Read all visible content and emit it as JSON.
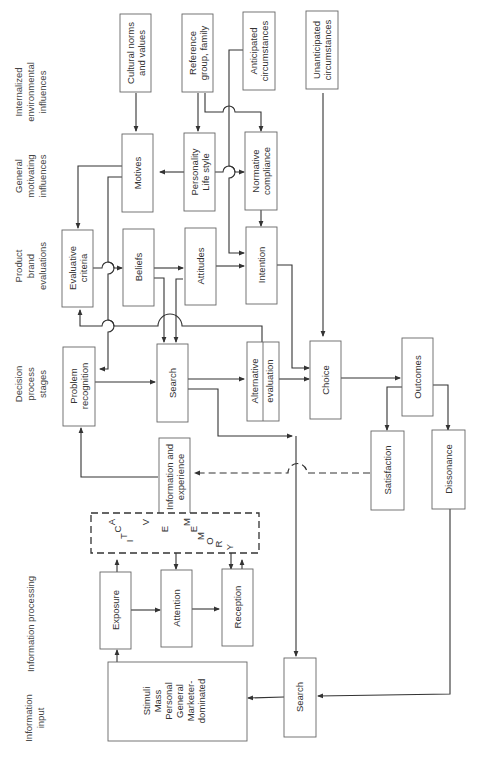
{
  "row_labels": {
    "internalized": [
      "Internalized",
      "environmental",
      "influences"
    ],
    "motivating": [
      "General",
      "motivating",
      "influences"
    ],
    "product": [
      "Product",
      "brand",
      "evaluations"
    ],
    "decision": [
      "Decision",
      "process",
      "stages"
    ],
    "info_processing": [
      "Information processing"
    ],
    "info_input": [
      "Information",
      "input"
    ]
  },
  "boxes": {
    "cultural": [
      "Cultural norms",
      "and values"
    ],
    "reference": [
      "Reference",
      "group, family"
    ],
    "anticipated": [
      "Anticipated",
      "circumstances"
    ],
    "unanticipated": [
      "Unanticipated",
      "circumstances"
    ],
    "motives": [
      "Motives"
    ],
    "personality": [
      "Personality",
      "Life style"
    ],
    "normative": [
      "Normative",
      "compliance"
    ],
    "evaluative": [
      "Evaluative",
      "criteria"
    ],
    "beliefs": [
      "Beliefs"
    ],
    "attitudes": [
      "Attitudes"
    ],
    "intention": [
      "Intention"
    ],
    "problem": [
      "Problem",
      "recognition"
    ],
    "search": [
      "Search"
    ],
    "alternative": [
      "Alternative",
      "evaluation"
    ],
    "choice": [
      "Choice"
    ],
    "outcomes": [
      "Outcomes"
    ],
    "satisfaction": [
      "Satisfaction"
    ],
    "dissonance": [
      "Dissonance"
    ],
    "info_exp": [
      "Information and",
      "experience"
    ],
    "exposure": [
      "Exposure"
    ],
    "attention": [
      "Attention"
    ],
    "reception": [
      "Reception"
    ],
    "stimuli": [
      "Stimuli",
      "Mass",
      "Personal",
      "General",
      "Marketer-",
      "dominated"
    ],
    "search_ext": [
      "Search"
    ]
  },
  "active_memory": {
    "word1": [
      "A",
      "C",
      "T",
      "I",
      "V",
      "E"
    ],
    "word2": [
      "M",
      "E",
      "M",
      "O",
      "R",
      "Y"
    ]
  }
}
